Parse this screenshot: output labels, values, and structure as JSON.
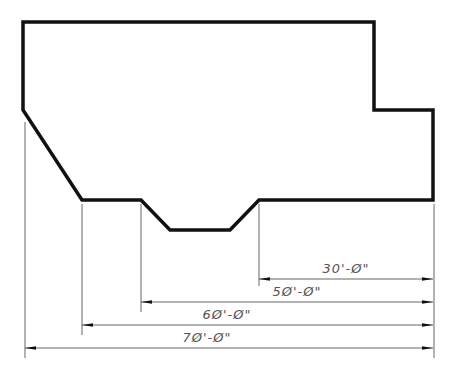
{
  "diagram": {
    "type": "architectural-floor-plan-dimensioning",
    "outline_points": [
      [
        23,
        22
      ],
      [
        374,
        22
      ],
      [
        374,
        110
      ],
      [
        433,
        110
      ],
      [
        433,
        200
      ],
      [
        259,
        200
      ],
      [
        230,
        230
      ],
      [
        170,
        230
      ],
      [
        141,
        200
      ],
      [
        82,
        200
      ],
      [
        23,
        110
      ]
    ],
    "stroke_color": "#111111",
    "dimension_color": "#555555"
  },
  "dimensions": [
    {
      "label": "30'-Ø\"",
      "from_x": 259,
      "to_x": 433,
      "y": 279,
      "text_x": 346,
      "text_y": 273
    },
    {
      "label": "5Ø'-Ø\"",
      "from_x": 141,
      "to_x": 433,
      "y": 302,
      "text_x": 297,
      "text_y": 296
    },
    {
      "label": "6Ø'-Ø\"",
      "from_x": 82,
      "to_x": 433,
      "y": 325,
      "text_x": 227,
      "text_y": 319
    },
    {
      "label": "7Ø'-Ø\"",
      "from_x": 25,
      "to_x": 433,
      "y": 348,
      "text_x": 207,
      "text_y": 342
    }
  ],
  "extension_lines": [
    {
      "x": 259,
      "y1": 204,
      "y2": 286
    },
    {
      "x": 141,
      "y1": 204,
      "y2": 312
    },
    {
      "x": 82,
      "y1": 204,
      "y2": 335
    },
    {
      "x": 25,
      "y1": 122,
      "y2": 358
    },
    {
      "x": 434,
      "y1": 204,
      "y2": 358
    }
  ]
}
